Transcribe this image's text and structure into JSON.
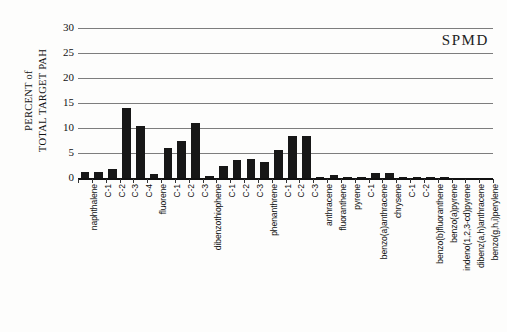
{
  "chart_data": {
    "type": "bar",
    "title": "",
    "annotation": "SPMD",
    "xlabel": "",
    "ylabel": "PERCENT of TOTAL TARGET PAH",
    "ylabel_lines": [
      "PERCENT of",
      "TOTAL TARGET PAH"
    ],
    "ylim": [
      0,
      30
    ],
    "ytick_values": [
      0,
      5,
      10,
      15,
      20,
      25,
      30
    ],
    "ytick_labels": [
      "0",
      "5",
      "10",
      "15",
      "20",
      "25",
      "30"
    ],
    "grid": true,
    "grid_axis": "y",
    "legend": false,
    "bar_color": "#171717",
    "categories": [
      "naphthalene",
      "C-1",
      "C-2",
      "C-3",
      "C-4",
      "fluorene",
      "C-1",
      "C-2",
      "C-3",
      "dibenzothiophene",
      "C-1",
      "C-2",
      "C-3",
      "phenanthrene",
      "C-1",
      "C-2",
      "C-3",
      "anthracene",
      "fluoranthene",
      "pyrene",
      "C-1",
      "benzo(a)anthracene",
      "chrysene",
      "C-1",
      "C-2",
      "benzo(b)fluoranthene",
      "benzo(a)pyrene",
      "indeno(1,2,3-cd)pyrene",
      "dibenz(a,h)anthracene",
      "benzo(g,h,i)perylene"
    ],
    "values": [
      1.3,
      1.2,
      1.9,
      14.0,
      10.4,
      0.8,
      6.1,
      7.5,
      11.1,
      0.5,
      2.5,
      3.6,
      3.8,
      3.3,
      5.7,
      8.4,
      8.5,
      0.1,
      0.6,
      0.3,
      0.3,
      1.0,
      1.0,
      0.3,
      0.3,
      0.1,
      0.05,
      0.0,
      0.0,
      0.0
    ]
  }
}
